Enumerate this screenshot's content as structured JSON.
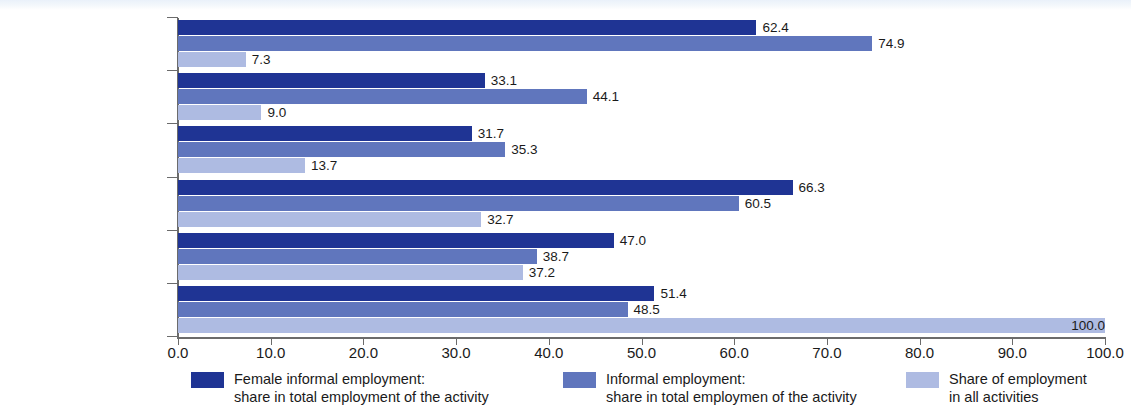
{
  "chart_data": {
    "type": "bar",
    "orientation": "horizontal",
    "title": "",
    "xlabel": "",
    "ylabel": "",
    "xlim": [
      0.0,
      100.0
    ],
    "grid": false,
    "xticks": [
      "0.0",
      "10.0",
      "20.0",
      "30.0",
      "40.0",
      "50.0",
      "60.0",
      "70.0",
      "80.0",
      "90.0",
      "100.0"
    ],
    "xtick_values": [
      0,
      10,
      20,
      30,
      40,
      50,
      60,
      70,
      80,
      90,
      100
    ],
    "categories": [
      "Construction",
      "Transportation",
      "Manufacturing",
      "Trade",
      "Services other than trade\nor transportation",
      "All non-agricultural\nactivities*"
    ],
    "series": [
      {
        "name": "Female informal employment:\nshare in total employment of the activity",
        "color": "#1f3494",
        "values": [
          62.4,
          33.1,
          31.7,
          66.3,
          47.0,
          51.4
        ],
        "labels": [
          "62.4",
          "33.1",
          "31.7",
          "66.3",
          "47.0",
          "51.4"
        ]
      },
      {
        "name": "Informal employment:\nshare in total employmen of the activity",
        "color": "#6076bd",
        "values": [
          74.9,
          44.1,
          35.3,
          60.5,
          38.7,
          48.5
        ],
        "labels": [
          "74.9",
          "44.1",
          "35.3",
          "60.5",
          "38.7",
          "48.5"
        ]
      },
      {
        "name": "Share of employment\nin all activities",
        "color": "#aebbe2",
        "values": [
          7.3,
          9.0,
          13.7,
          32.7,
          37.2,
          100.0
        ],
        "labels": [
          "7.3",
          "9.0",
          "13.7",
          "32.7",
          "37.2",
          "100.0"
        ]
      }
    ],
    "legend_position": "bottom"
  },
  "legend": {
    "items": [
      {
        "label": "Female informal employment:\nshare in total employment of the activity",
        "color": "#1f3494"
      },
      {
        "label": "Informal employment:\nshare in total employmen of the activity",
        "color": "#6076bd"
      },
      {
        "label": "Share of employment\nin all activities",
        "color": "#aebbe2"
      }
    ]
  }
}
